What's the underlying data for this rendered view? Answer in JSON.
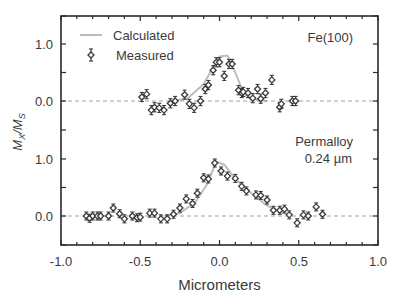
{
  "chart_data": {
    "type": "scatter",
    "title": "",
    "xlabel": "Micrometers",
    "ylabel": "M_X / M_S",
    "xlim": [
      -1.0,
      1.0
    ],
    "x_ticks": [
      "-1.0",
      "-0.5",
      "0.0",
      "0.5",
      "1.0"
    ],
    "grid": false,
    "legend": {
      "position": "upper-left",
      "entries": [
        {
          "label": "Calculated",
          "style": "gray line"
        },
        {
          "label": "Measured",
          "style": "diamond marker with error bars"
        }
      ]
    },
    "panels": [
      {
        "name": "Fe(100)",
        "annotation": "Fe(100)",
        "y_ticks": [
          "1.0",
          "0.0"
        ],
        "ylim": [
          -0.5,
          1.5
        ],
        "baseline": 0.0,
        "series": [
          {
            "name": "Measured",
            "error": 0.08,
            "x": [
              -0.49,
              -0.46,
              -0.43,
              -0.41,
              -0.38,
              -0.35,
              -0.31,
              -0.28,
              -0.22,
              -0.19,
              -0.16,
              -0.12,
              -0.09,
              -0.07,
              -0.04,
              -0.02,
              0.0,
              0.03,
              0.06,
              0.08,
              0.12,
              0.14,
              0.15,
              0.18,
              0.21,
              0.24,
              0.26,
              0.29,
              0.33,
              0.38,
              0.39,
              0.46,
              0.48
            ],
            "y": [
              0.07,
              0.12,
              -0.16,
              -0.11,
              -0.12,
              -0.16,
              -0.04,
              0.0,
              0.11,
              -0.05,
              -0.12,
              0.0,
              0.21,
              0.28,
              0.54,
              0.68,
              0.68,
              0.44,
              0.65,
              0.65,
              0.19,
              0.14,
              0.16,
              0.14,
              0.05,
              0.21,
              0.04,
              0.14,
              0.37,
              -0.11,
              -0.05,
              0.0,
              0.0
            ]
          },
          {
            "name": "Calculated",
            "x": [
              -0.3,
              -0.2,
              -0.1,
              -0.05,
              0.0,
              0.05,
              0.1,
              0.15,
              0.2,
              0.3
            ],
            "y": [
              0.0,
              0.05,
              0.3,
              0.55,
              0.78,
              0.8,
              0.5,
              0.15,
              0.03,
              0.0
            ]
          }
        ]
      },
      {
        "name": "Permalloy 0.24 µm",
        "annotation_lines": [
          "Permalloy",
          "0.24 µm"
        ],
        "y_ticks": [
          "1.0",
          "0.0"
        ],
        "ylim": [
          -0.5,
          1.5
        ],
        "baseline": 0.0,
        "series": [
          {
            "name": "Measured",
            "error": 0.07,
            "x": [
              -0.84,
              -0.82,
              -0.8,
              -0.77,
              -0.75,
              -0.7,
              -0.67,
              -0.63,
              -0.6,
              -0.55,
              -0.52,
              -0.5,
              -0.44,
              -0.41,
              -0.37,
              -0.33,
              -0.29,
              -0.25,
              -0.21,
              -0.17,
              -0.14,
              -0.1,
              -0.07,
              -0.03,
              0.01,
              0.05,
              0.1,
              0.14,
              0.17,
              0.23,
              0.26,
              0.3,
              0.34,
              0.38,
              0.41,
              0.44,
              0.49,
              0.53,
              0.56,
              0.61,
              0.65
            ],
            "y": [
              0.0,
              -0.04,
              0.0,
              0.0,
              0.0,
              0.0,
              0.14,
              0.04,
              -0.05,
              0.0,
              -0.03,
              -0.02,
              0.05,
              0.05,
              -0.05,
              -0.05,
              0.03,
              0.14,
              0.3,
              0.22,
              0.4,
              0.67,
              0.65,
              0.93,
              0.79,
              0.7,
              0.66,
              0.52,
              0.44,
              0.37,
              0.36,
              0.28,
              0.1,
              0.1,
              0.12,
              0.02,
              -0.12,
              0.02,
              0.0,
              0.16,
              0.03
            ]
          },
          {
            "name": "Calculated",
            "x": [
              -0.35,
              -0.25,
              -0.15,
              -0.08,
              -0.02,
              0.03,
              0.1,
              0.2,
              0.3,
              0.4
            ],
            "y": [
              0.0,
              0.05,
              0.25,
              0.55,
              0.95,
              0.9,
              0.65,
              0.4,
              0.18,
              0.05
            ]
          }
        ]
      }
    ]
  },
  "labels": {
    "xlabel": "Micrometers",
    "ylabel_main": "M",
    "ylabel_sub1": "X",
    "ylabel_slash": "/",
    "ylabel_main2": "M",
    "ylabel_sub2": "S",
    "legend_calculated": "Calculated",
    "legend_measured": "Measured",
    "panel_top": "Fe(100)",
    "panel_bottom_line1": "Permalloy",
    "panel_bottom_line2": "0.24 µm",
    "xtick_0": "-1.0",
    "xtick_1": "-0.5",
    "xtick_2": "0.0",
    "xtick_3": "0.5",
    "xtick_4": "1.0",
    "ytick_top_1": "1.0",
    "ytick_top_0": "0.0",
    "ytick_bot_1": "1.0",
    "ytick_bot_0": "0.0"
  },
  "colors": {
    "axis": "#2a2a2a",
    "marker": "#3a3a3a",
    "calculated": "#bdbdbd",
    "baseline": "#8a8a8a"
  }
}
